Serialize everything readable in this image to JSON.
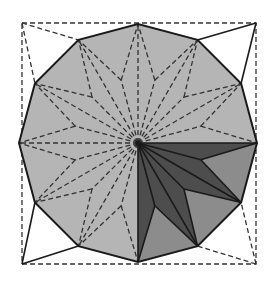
{
  "diagram": {
    "canvas": {
      "width": 280,
      "height": 289
    },
    "center": [
      138,
      143
    ],
    "outer_radius": 119,
    "star_radius": 65,
    "square": {
      "x1": 22,
      "y1": 23,
      "x2": 256,
      "y2": 264
    },
    "colors": {
      "background": "#ffffff",
      "polygon_fill": "#b5b5b5",
      "dark_fill": "#4d4d4d",
      "medium_fill": "#8c8c8c",
      "stroke": "#1a1a1a",
      "dash_stroke": "#333333"
    },
    "corner_lines": {
      "top_left": "dashed",
      "top_right": "solid",
      "bottom_left": "solid",
      "bottom_right": "dashed"
    },
    "shaded_quadrant_degrees": [
      0,
      90
    ]
  }
}
